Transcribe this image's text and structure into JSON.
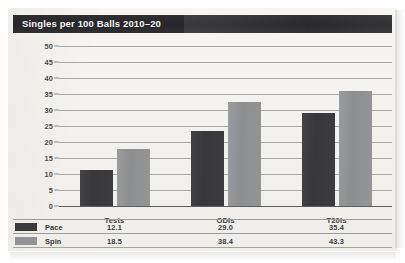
{
  "header": {
    "title": "Singles per 100 Balls 2010–20"
  },
  "colors": {
    "pace": "#3b3b3d",
    "spin": "#919394",
    "title_bar_bg": "#2b2b2e",
    "title_text": "#f4f4f2",
    "gridline": "#a8a8a6",
    "page_bg": "#f3f2ee"
  },
  "chart_data": {
    "type": "bar",
    "title": "Singles per 100 Balls 2010–20",
    "xlabel": "",
    "ylabel": "",
    "ylim": [
      0,
      50
    ],
    "yticks": [
      0,
      5,
      10,
      15,
      20,
      25,
      30,
      35,
      40,
      45,
      50
    ],
    "grid": true,
    "legend_position": "table-below",
    "categories": [
      "Tests",
      "ODIs",
      "T20Is"
    ],
    "series": [
      {
        "name": "Pace",
        "values": [
          11.4,
          23.5,
          29.2
        ],
        "table_values": [
          "12.1",
          "29.0",
          "35.4"
        ],
        "color": "#3b3b3d"
      },
      {
        "name": "Spin",
        "values": [
          17.8,
          32.5,
          35.9
        ],
        "table_values": [
          "18.5",
          "38.4",
          "43.3"
        ],
        "color": "#919394"
      }
    ]
  },
  "table": {
    "rows": [
      {
        "label": "Pace",
        "cells": [
          "12.1",
          "29.0",
          "35.4"
        ]
      },
      {
        "label": "Spin",
        "cells": [
          "18.5",
          "38.4",
          "43.3"
        ]
      }
    ]
  }
}
